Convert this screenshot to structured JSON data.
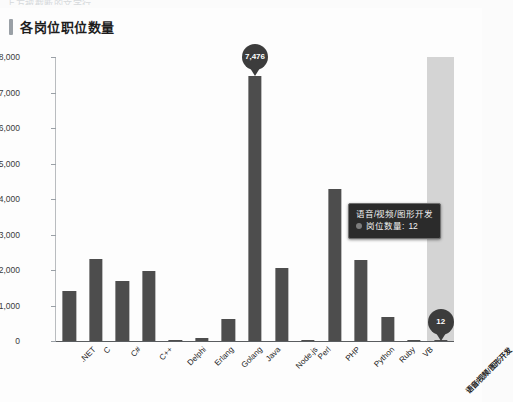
{
  "page": {
    "clipped_top_text": "上方被截断的文字行",
    "title": "各岗位职位数量",
    "accent_color": "#9aa0a6",
    "bar_color": "#4d4d4d",
    "tooltip_bg": "#2b2b2b",
    "highlight_color": "rgba(0,0,0,0.16)"
  },
  "tooltip": {
    "title": "语音/视频/图形开发",
    "series_label": "岗位数量:",
    "value": "12"
  },
  "markers": [
    {
      "category": "Java",
      "label": "7,476"
    },
    {
      "category": "语音/视频/图形开发",
      "label": "12"
    }
  ],
  "chart_data": {
    "type": "bar",
    "title": "各岗位职位数量",
    "xlabel": "",
    "ylabel": "",
    "ylim": [
      0,
      8000
    ],
    "yticks": [
      0,
      1000,
      2000,
      3000,
      4000,
      5000,
      6000,
      7000,
      8000
    ],
    "ytick_labels": [
      "0",
      "1,000",
      "2,000",
      "3,000",
      "4,000",
      "5,000",
      "6,000",
      "7,000",
      "8,000"
    ],
    "grid": false,
    "legend": "none",
    "categories": [
      ".NET",
      "C",
      "C#",
      "C++",
      "Delphi",
      "Erlang",
      "Golang",
      "Java",
      "Node.js",
      "Perl",
      "PHP",
      "Python",
      "Ruby",
      "VB",
      "语音/视频/图形开发"
    ],
    "values": [
      1400,
      2320,
      1680,
      1980,
      40,
      90,
      620,
      7476,
      2070,
      30,
      4280,
      2270,
      680,
      25,
      12
    ],
    "series": [
      {
        "name": "岗位数量",
        "values": [
          1400,
          2320,
          1680,
          1980,
          40,
          90,
          620,
          7476,
          2070,
          30,
          4280,
          2270,
          680,
          25,
          12
        ]
      }
    ],
    "highlighted_category": "语音/视频/图形开发"
  }
}
